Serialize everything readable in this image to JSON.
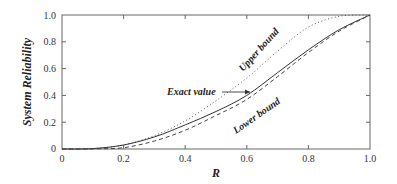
{
  "chart_data": {
    "type": "line",
    "title": "",
    "xlabel": "R",
    "ylabel": "System Reliability",
    "xlim": [
      0,
      1.0
    ],
    "ylim": [
      0,
      1.0
    ],
    "x_ticks": [
      "0",
      "0.2",
      "0.4",
      "0.6",
      "0.8",
      "1.0"
    ],
    "y_ticks": [
      "0",
      "0.2",
      "0.4",
      "0.6",
      "0.8",
      "1.0"
    ],
    "grid": false,
    "legend": "none (inline annotations)",
    "x": [
      0,
      0.1,
      0.2,
      0.3,
      0.4,
      0.5,
      0.6,
      0.7,
      0.8,
      0.9,
      1.0
    ],
    "series": [
      {
        "name": "Upper bound",
        "style": "dotted",
        "values": [
          0,
          0.003,
          0.03,
          0.1,
          0.21,
          0.36,
          0.53,
          0.73,
          0.91,
          0.99,
          1.0
        ]
      },
      {
        "name": "Exact value",
        "style": "solid",
        "values": [
          0,
          0.003,
          0.03,
          0.09,
          0.18,
          0.28,
          0.4,
          0.57,
          0.74,
          0.89,
          1.0
        ]
      },
      {
        "name": "Lower bound",
        "style": "dashed",
        "values": [
          0,
          0.001,
          0.01,
          0.06,
          0.14,
          0.25,
          0.37,
          0.54,
          0.72,
          0.88,
          1.0
        ]
      }
    ],
    "annotations": [
      {
        "text": "Upper bound",
        "near_x": 0.7,
        "rotated": true
      },
      {
        "text": "Exact value",
        "arrow_to_x": 0.62,
        "arrow_to_y": 0.41
      },
      {
        "text": "Lower bound",
        "near_x": 0.68,
        "rotated": true
      }
    ]
  },
  "labels": {
    "xlabel": "R",
    "ylabel": "System Reliability",
    "upper": "Upper bound",
    "exact": "Exact value",
    "lower": "Lower bound",
    "xt0": "0",
    "xt1": "0.2",
    "xt2": "0.4",
    "xt3": "0.6",
    "xt4": "0.8",
    "xt5": "1.0",
    "yt0": "0",
    "yt1": "0.2",
    "yt2": "0.4",
    "yt3": "0.6",
    "yt4": "0.8",
    "yt5": "1.0"
  }
}
